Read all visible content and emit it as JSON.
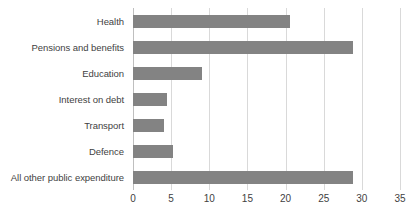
{
  "chart_data": {
    "type": "bar",
    "orientation": "horizontal",
    "title": "",
    "subtitle": "",
    "xlabel": "",
    "ylabel": "",
    "categories": [
      "Health",
      "Pensions and benefits",
      "Education",
      "Interest on debt",
      "Transport",
      "Defence",
      "All other public expenditure"
    ],
    "values": [
      20.6,
      28.8,
      9.1,
      4.4,
      4.0,
      5.3,
      28.8
    ],
    "series": [
      {
        "name": "Public expenditure",
        "values": [
          20.6,
          28.8,
          9.1,
          4.4,
          4.0,
          5.3,
          28.8
        ]
      }
    ],
    "xlim": [
      0,
      35
    ],
    "xticks": [
      0,
      5,
      10,
      15,
      20,
      25,
      30,
      35
    ],
    "xtick_labels": [
      "0",
      "5",
      "10",
      "15",
      "20",
      "25",
      "30",
      "35"
    ],
    "grid": true,
    "grid_axis": "x",
    "legend": false,
    "legend_position": "none",
    "annotations": []
  },
  "style": {
    "bar_color": "#838383",
    "gridline_color": "#d9d9d9",
    "axis_line_color": "#bfbfbf",
    "text_color": "#3f3f3f",
    "background": "#ffffff"
  }
}
